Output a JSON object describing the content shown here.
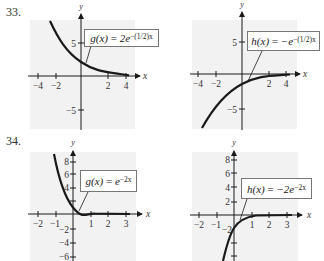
{
  "problems": [
    {
      "number": "33.",
      "graphs": [
        {
          "function_name": "g(x)",
          "equals": " = ",
          "base": "2e",
          "exponent": "−(1/2)x",
          "x_ticks": [
            "−4",
            "−2",
            "2",
            "4"
          ],
          "y_ticks": [
            "5",
            "−5"
          ],
          "x_label": "x",
          "y_label": "y"
        },
        {
          "function_name": "h(x)",
          "equals": " = ",
          "base": "−e",
          "exponent": "−(1/2)x",
          "x_ticks": [
            "−4",
            "−2",
            "2",
            "4"
          ],
          "y_ticks": [
            "5",
            "−5"
          ],
          "x_label": "x",
          "y_label": "y"
        }
      ]
    },
    {
      "number": "34.",
      "graphs": [
        {
          "function_name": "g(x)",
          "equals": " = ",
          "base": "e",
          "exponent": "−2x",
          "x_ticks": [
            "−2",
            "−1",
            "1",
            "2",
            "3"
          ],
          "y_ticks": [
            "8",
            "6",
            "4",
            "−2",
            "−4",
            "−6"
          ],
          "x_label": "x",
          "y_label": "y"
        },
        {
          "function_name": "h(x)",
          "equals": " = ",
          "base": "−2e",
          "exponent": "−2x",
          "x_ticks": [
            "−2",
            "−1",
            "1",
            "2",
            "3"
          ],
          "y_ticks": [
            "8",
            "6",
            "4",
            "2",
            "−2"
          ],
          "x_label": "x",
          "y_label": "y"
        }
      ]
    }
  ],
  "colors": {
    "panel": "#f2f2f2",
    "ink": "#1a1a1a",
    "box_border": "#777777"
  }
}
